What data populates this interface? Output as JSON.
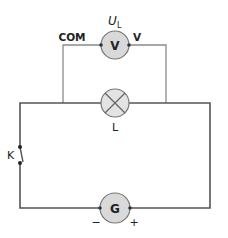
{
  "diagram": {
    "type": "electric-circuit",
    "components": {
      "voltmeter": {
        "symbol": "V",
        "label_main": "U",
        "label_sub": "L",
        "terminal_left": "COM",
        "terminal_right": "V"
      },
      "lamp": {
        "label": "L"
      },
      "switch": {
        "label": "K"
      },
      "source": {
        "symbol": "G",
        "minus": "−",
        "plus": "+"
      }
    },
    "colors": {
      "wire": "#555555",
      "meter_wire": "#888888",
      "component_fill": "#d9d9d9",
      "component_stroke": "#666666",
      "text": "#222222"
    }
  }
}
